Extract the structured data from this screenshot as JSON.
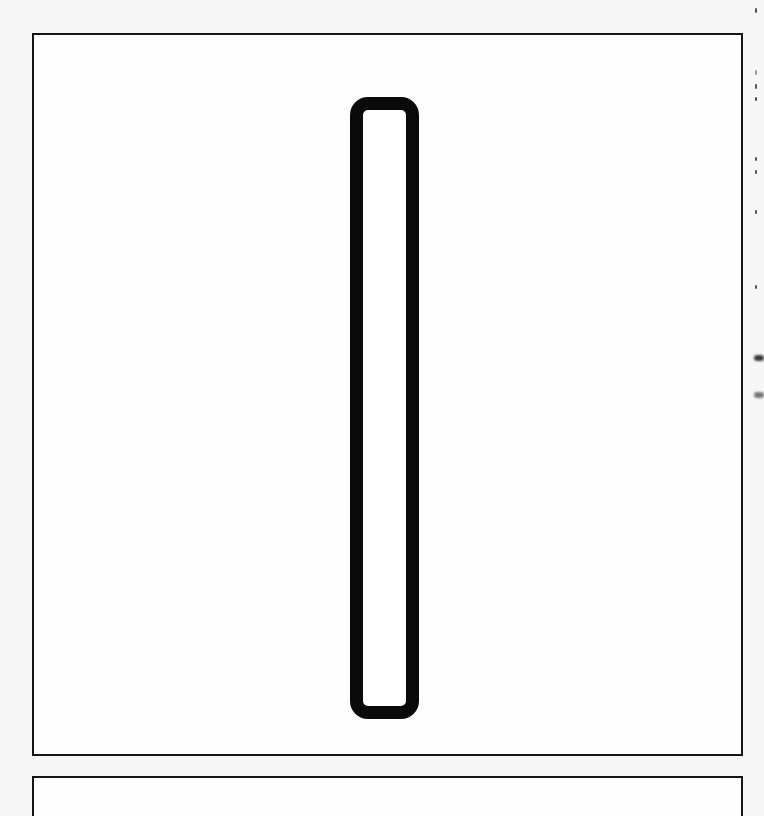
{
  "canvas": {
    "background": "#f7f7f7",
    "frame_fill": "#fefefe",
    "stroke_color": "#151515"
  },
  "frames": [
    {
      "id": "main",
      "label": ""
    },
    {
      "id": "lower",
      "label": ""
    }
  ],
  "shape": {
    "type": "rounded-rectangle-outline",
    "orientation": "vertical",
    "stroke_color": "#0a0a0a",
    "fill": "#ffffff"
  }
}
